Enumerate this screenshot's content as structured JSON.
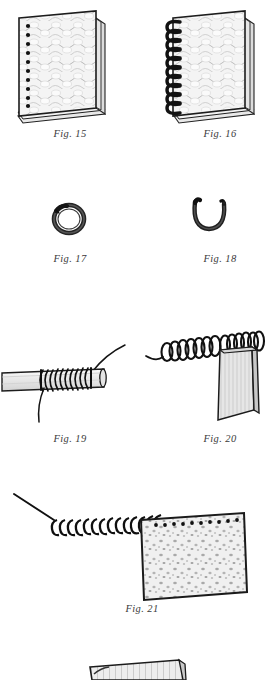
{
  "page": {
    "kind": "illustration-plate",
    "background_color": "#ffffff",
    "ink_color": "#1a1a1a",
    "paper_tone": "#f2f2f2",
    "width": 263,
    "height": 677
  },
  "figures": [
    {
      "id": "fig15",
      "caption": "Fig. 15",
      "subject": "stack-of-punched-sheets",
      "description": "Stack of textured sheets with a column of round punched holes along the left edge",
      "hole_count": 11,
      "x": 12,
      "y": 8,
      "width": 90,
      "height": 112,
      "caption_x": 20,
      "caption_y": 128
    },
    {
      "id": "fig16",
      "caption": "Fig. 16",
      "subject": "spiral-bound-notebook",
      "description": "Pad of sheets bound with a wire spiral coil through the left edge holes",
      "coil_loops": 11,
      "x": 162,
      "y": 8,
      "width": 90,
      "height": 112,
      "caption_x": 170,
      "caption_y": 128
    },
    {
      "id": "fig17",
      "caption": "Fig. 17",
      "subject": "closed-split-ring",
      "description": "Single closed wire ring seen at a slight angle",
      "x": 50,
      "y": 200,
      "width": 36,
      "height": 34,
      "caption_x": 20,
      "caption_y": 253
    },
    {
      "id": "fig18",
      "caption": "Fig. 18",
      "subject": "open-u-hook",
      "description": "Open U-shaped wire hook with two upturned ends",
      "x": 190,
      "y": 198,
      "width": 34,
      "height": 32,
      "caption_x": 170,
      "caption_y": 253
    },
    {
      "id": "fig19",
      "caption": "Fig. 19",
      "subject": "wire-coiled-on-mandrel",
      "description": "Wire wound in a tight helix around a cylindrical rod, with a free tail at each end",
      "x": 6,
      "y": 330,
      "width": 115,
      "height": 90,
      "caption_x": 20,
      "caption_y": 433
    },
    {
      "id": "fig20",
      "caption": "Fig. 20",
      "subject": "coil-threaded-through-plate",
      "description": "Helical coil passing through a flat rectangular plate standing on edge",
      "coil_loops": 14,
      "x": 150,
      "y": 335,
      "width": 108,
      "height": 90,
      "caption_x": 170,
      "caption_y": 433
    },
    {
      "id": "fig21",
      "caption": "Fig. 21",
      "subject": "coil-threading-into-sheet",
      "description": "Long wire helix being threaded into the punched holes along the top edge of a speckled sheet",
      "coil_loops": 16,
      "hole_count": 11,
      "x": 10,
      "y": 488,
      "width": 245,
      "height": 110,
      "caption_x": 92,
      "caption_y": 603
    },
    {
      "id": "fig22-partial",
      "caption": "",
      "subject": "partial-figure-cropped",
      "description": "Top sliver of the next figure, cut off by the bottom edge of the page",
      "x": 88,
      "y": 658,
      "width": 92,
      "height": 19,
      "caption_x": 0,
      "caption_y": 0
    }
  ]
}
